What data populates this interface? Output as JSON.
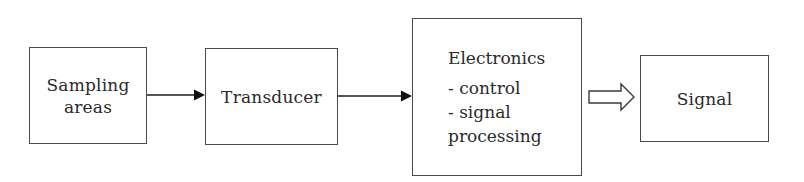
{
  "diagram": {
    "type": "block-flow",
    "blocks": [
      {
        "id": "sampling",
        "label_lines": [
          "Sampling",
          "areas"
        ]
      },
      {
        "id": "transducer",
        "label_lines": [
          "Transducer"
        ]
      },
      {
        "id": "electronics",
        "title": "Electronics",
        "items": [
          "- control",
          "- signal",
          "processing"
        ]
      },
      {
        "id": "signal",
        "label_lines": [
          "Signal"
        ]
      }
    ],
    "connections": [
      {
        "from": "sampling",
        "to": "transducer",
        "style": "solid-arrow"
      },
      {
        "from": "transducer",
        "to": "electronics",
        "style": "solid-arrow"
      },
      {
        "from": "electronics",
        "to": "signal",
        "style": "hollow-block-arrow"
      }
    ],
    "colors": {
      "stroke": "#4a4a4a",
      "text": "#2a2a2a",
      "background": "#ffffff"
    }
  }
}
